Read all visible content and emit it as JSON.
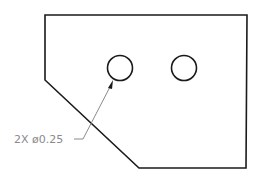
{
  "drawing": {
    "part_outline": {
      "points": "45,15 247,15 246,168 139,168 45,80",
      "stroke": "#1a1a1a"
    },
    "holes": [
      {
        "cx": 120,
        "cy": 68,
        "r": 12.5
      },
      {
        "cx": 184,
        "cy": 68,
        "r": 12.5
      }
    ],
    "callout": {
      "quantity": "2X",
      "symbol": "ø",
      "value": "0.25",
      "label": "2X  ø0.25",
      "color": "#8a8a8a"
    }
  }
}
